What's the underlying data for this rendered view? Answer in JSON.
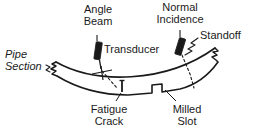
{
  "figure": {
    "stroke_color": "#1a1a1a",
    "transducer_fill": "#1a1a1a",
    "background": "#ffffff"
  },
  "labels": {
    "angle_beam": "Angle\nBeam",
    "normal_incidence": "Normal\nIncidence",
    "standoff": "Standoff",
    "transducer": "Transducer",
    "pipe_section": "Pipe\nSection",
    "fatigue_crack": "Fatigue\nCrack",
    "milled_slot": "Milled\nSlot"
  },
  "callouts": [
    {
      "name": "angle-beam",
      "label": "Angle Beam",
      "target": "angle-beam-transducer"
    },
    {
      "name": "normal-incidence",
      "label": "Normal Incidence",
      "target": "normal-incidence-transducer"
    },
    {
      "name": "standoff",
      "label": "Standoff",
      "target": "standoff-wedge"
    },
    {
      "name": "transducer",
      "label": "Transducer",
      "target": "transducer-group"
    },
    {
      "name": "pipe-section",
      "label": "Pipe Section",
      "target": "pipe-body"
    },
    {
      "name": "fatigue-crack",
      "label": "Fatigue Crack",
      "target": "fatigue-crack-defect"
    },
    {
      "name": "milled-slot",
      "label": "Milled Slot",
      "target": "milled-slot-defect"
    }
  ]
}
